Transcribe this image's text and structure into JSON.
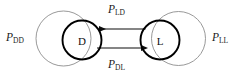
{
  "diagram": {
    "type": "state-transition-diagram",
    "background_color": "#ffffff",
    "node_stroke_color": "#000000",
    "loop_stroke_color": "#8d8d8d",
    "arrow_color": "#0d0d0d",
    "nodes": [
      {
        "id": "D",
        "label": "D"
      },
      {
        "id": "L",
        "label": "L"
      }
    ],
    "edges": [
      {
        "id": "P_DD",
        "kind": "self-loop",
        "from": "D",
        "to": "D",
        "base": "P",
        "sub": "DD",
        "position": "left"
      },
      {
        "id": "P_LD",
        "kind": "transition",
        "from": "L",
        "to": "D",
        "base": "P",
        "sub": "LD",
        "position": "top",
        "direction": "left"
      },
      {
        "id": "P_DL",
        "kind": "transition",
        "from": "D",
        "to": "L",
        "base": "P",
        "sub": "DL",
        "position": "bottom",
        "direction": "right"
      },
      {
        "id": "P_LL",
        "kind": "self-loop",
        "from": "L",
        "to": "L",
        "base": "P",
        "sub": "LL",
        "position": "right"
      }
    ]
  }
}
